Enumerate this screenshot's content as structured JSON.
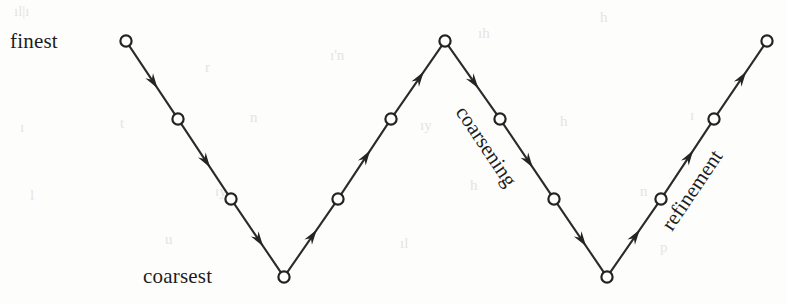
{
  "figure": {
    "type": "diagram",
    "name": "multigrid-v-cycle",
    "background_color": "#fdfdfc",
    "line_color": "#2b2b2b",
    "node_fill": "#ffffff",
    "node_stroke": "#232323",
    "text_color": "#1d1d1d",
    "width": 787,
    "height": 304
  },
  "labels": {
    "finest": "finest",
    "coarsest": "coarsest",
    "coarsening": "coarsening",
    "refinement": "refinement"
  },
  "label_positions": {
    "finest": {
      "x": 10,
      "y": 48
    },
    "coarsest": {
      "x": 143,
      "y": 283
    },
    "coarsening": {
      "x": 455,
      "y": 112,
      "rotation": 56
    },
    "refinement": {
      "x": 672,
      "y": 232,
      "rotation": -56
    }
  },
  "levels": [
    {
      "index": 0,
      "name": "finest",
      "y": 41
    },
    {
      "index": 1,
      "name": "level-2",
      "y": 119
    },
    {
      "index": 2,
      "name": "level-3",
      "y": 199
    },
    {
      "index": 3,
      "name": "coarsest",
      "y": 277
    }
  ],
  "nodes": [
    {
      "id": "n1",
      "x": 126,
      "y": 41,
      "level": 0
    },
    {
      "id": "n2",
      "x": 178,
      "y": 119,
      "level": 1
    },
    {
      "id": "n3",
      "x": 231,
      "y": 199,
      "level": 2
    },
    {
      "id": "n4",
      "x": 284,
      "y": 277,
      "level": 3
    },
    {
      "id": "n5",
      "x": 338,
      "y": 199,
      "level": 2
    },
    {
      "id": "n6",
      "x": 391,
      "y": 119,
      "level": 1
    },
    {
      "id": "n7",
      "x": 445,
      "y": 41,
      "level": 0
    },
    {
      "id": "n8",
      "x": 500,
      "y": 119,
      "level": 1
    },
    {
      "id": "n9",
      "x": 554,
      "y": 199,
      "level": 2
    },
    {
      "id": "n10",
      "x": 607,
      "y": 277,
      "level": 3
    },
    {
      "id": "n11",
      "x": 661,
      "y": 199,
      "level": 2
    },
    {
      "id": "n12",
      "x": 714,
      "y": 119,
      "level": 1
    },
    {
      "id": "n13",
      "x": 767,
      "y": 41,
      "level": 0
    }
  ],
  "node_radius": 5.6,
  "edges": [
    {
      "from": "n1",
      "to": "n2",
      "direction": "down",
      "kind": "coarsening"
    },
    {
      "from": "n2",
      "to": "n3",
      "direction": "down",
      "kind": "coarsening"
    },
    {
      "from": "n3",
      "to": "n4",
      "direction": "down",
      "kind": "coarsening"
    },
    {
      "from": "n4",
      "to": "n5",
      "direction": "up",
      "kind": "refinement"
    },
    {
      "from": "n5",
      "to": "n6",
      "direction": "up",
      "kind": "refinement"
    },
    {
      "from": "n6",
      "to": "n7",
      "direction": "up",
      "kind": "refinement"
    },
    {
      "from": "n7",
      "to": "n8",
      "direction": "down",
      "kind": "coarsening"
    },
    {
      "from": "n8",
      "to": "n9",
      "direction": "down",
      "kind": "coarsening"
    },
    {
      "from": "n9",
      "to": "n10",
      "direction": "down",
      "kind": "coarsening"
    },
    {
      "from": "n10",
      "to": "n11",
      "direction": "up",
      "kind": "refinement"
    },
    {
      "from": "n11",
      "to": "n12",
      "direction": "up",
      "kind": "refinement"
    },
    {
      "from": "n12",
      "to": "n13",
      "direction": "up",
      "kind": "refinement"
    }
  ],
  "arrow": {
    "length": 15,
    "half_width": 4.6,
    "position_along_edge": 0.62
  },
  "scan_artifacts": [
    {
      "x": 14,
      "y": 16,
      "text": "ıl|ı"
    },
    {
      "x": 205,
      "y": 72,
      "text": "r"
    },
    {
      "x": 330,
      "y": 60,
      "text": "ı'n"
    },
    {
      "x": 478,
      "y": 38,
      "text": "ıh"
    },
    {
      "x": 600,
      "y": 22,
      "text": "h"
    },
    {
      "x": 20,
      "y": 132,
      "text": "ı"
    },
    {
      "x": 120,
      "y": 128,
      "text": "t"
    },
    {
      "x": 250,
      "y": 122,
      "text": "n"
    },
    {
      "x": 420,
      "y": 130,
      "text": "ıy"
    },
    {
      "x": 560,
      "y": 126,
      "text": "h"
    },
    {
      "x": 690,
      "y": 120,
      "text": "ı"
    },
    {
      "x": 30,
      "y": 200,
      "text": "l"
    },
    {
      "x": 215,
      "y": 196,
      "text": "ıy"
    },
    {
      "x": 470,
      "y": 190,
      "text": "h"
    },
    {
      "x": 640,
      "y": 196,
      "text": "n"
    },
    {
      "x": 165,
      "y": 244,
      "text": "u"
    },
    {
      "x": 400,
      "y": 248,
      "text": "ıl"
    },
    {
      "x": 660,
      "y": 252,
      "text": "p"
    }
  ]
}
